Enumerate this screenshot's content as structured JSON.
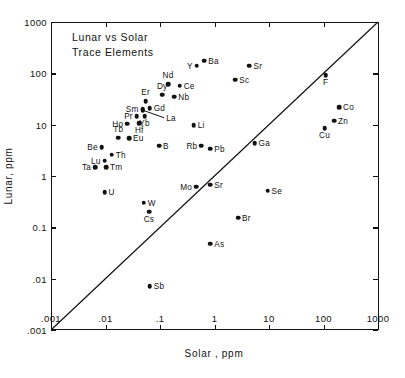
{
  "chart_data": {
    "type": "scatter",
    "title": "Lunar vs Solar Trace Elements",
    "title_lines": [
      "Lunar vs Solar",
      "Trace Elements"
    ],
    "xlabel": "Solar , ppm",
    "ylabel": "Lunar, ppm",
    "xscale": "log",
    "yscale": "log",
    "xlim": [
      0.001,
      1000
    ],
    "ylim": [
      0.001,
      1000
    ],
    "grid": false,
    "legend": "none",
    "xticklabels": [
      ".001",
      ".01",
      ".1",
      "1",
      "10",
      "100",
      "1000"
    ],
    "yticklabels": [
      ".001",
      ".01",
      "0.1",
      "1",
      "10",
      "100",
      "1000"
    ],
    "xtickvalues": [
      0.001,
      0.01,
      0.1,
      1,
      10,
      100,
      1000
    ],
    "ytickvalues": [
      0.001,
      0.01,
      0.1,
      1,
      10,
      100,
      1000
    ],
    "annotations": [
      {
        "name": "one-to-one-line",
        "type": "reference-line",
        "description": "1:1 diagonal line from (.001,.001) to (1000,1000)",
        "from": [
          0.001,
          0.001
        ],
        "to": [
          1000,
          1000
        ]
      },
      {
        "name": "la-leader-line",
        "type": "leader-line",
        "label": "La",
        "from_label_xy": [
          0.115,
          13.5
        ],
        "to_point_xy": [
          0.046,
          19.0
        ]
      }
    ],
    "points": [
      {
        "label": "Ba",
        "x": 0.62,
        "y": 175,
        "lpos": "right"
      },
      {
        "label": "Y",
        "x": 0.45,
        "y": 140,
        "lpos": "left"
      },
      {
        "label": "Sr",
        "x": 4.2,
        "y": 140,
        "lpos": "right"
      },
      {
        "label": "Sc",
        "x": 2.3,
        "y": 75,
        "lpos": "right"
      },
      {
        "label": "Nd",
        "x": 0.135,
        "y": 62,
        "lpos": "above"
      },
      {
        "label": "Ce",
        "x": 0.22,
        "y": 57,
        "lpos": "right"
      },
      {
        "label": "Dy",
        "x": 0.105,
        "y": 38,
        "lpos": "above"
      },
      {
        "label": "Nb",
        "x": 0.175,
        "y": 35,
        "lpos": "right"
      },
      {
        "label": "Er",
        "x": 0.052,
        "y": 29,
        "lpos": "above"
      },
      {
        "label": "Gd",
        "x": 0.062,
        "y": 21,
        "lpos": "right"
      },
      {
        "label": "Sm",
        "x": 0.046,
        "y": 20,
        "lpos": "left"
      },
      {
        "label": "Yb",
        "x": 0.05,
        "y": 14.5,
        "lpos": "below"
      },
      {
        "label": "Pr",
        "x": 0.036,
        "y": 14.5,
        "lpos": "left"
      },
      {
        "label": "La",
        "x": 0.046,
        "y": 19.0,
        "lpos": "none"
      },
      {
        "label": "Hf",
        "x": 0.04,
        "y": 10.8,
        "lpos": "below"
      },
      {
        "label": "Ho",
        "x": 0.024,
        "y": 10.5,
        "lpos": "left"
      },
      {
        "label": "Li",
        "x": 0.4,
        "y": 9.8,
        "lpos": "right"
      },
      {
        "label": "Tb",
        "x": 0.0165,
        "y": 5.6,
        "lpos": "above"
      },
      {
        "label": "Eu",
        "x": 0.026,
        "y": 5.4,
        "lpos": "right"
      },
      {
        "label": "Be",
        "x": 0.0082,
        "y": 3.6,
        "lpos": "left"
      },
      {
        "label": "B",
        "x": 0.092,
        "y": 3.9,
        "lpos": "right"
      },
      {
        "label": "Rb",
        "x": 0.55,
        "y": 3.9,
        "lpos": "left"
      },
      {
        "label": "Pb",
        "x": 0.8,
        "y": 3.4,
        "lpos": "right"
      },
      {
        "label": "Ga",
        "x": 5.2,
        "y": 4.3,
        "lpos": "right"
      },
      {
        "label": "Th",
        "x": 0.0125,
        "y": 2.6,
        "lpos": "right"
      },
      {
        "label": "Lu",
        "x": 0.0092,
        "y": 2.0,
        "lpos": "left"
      },
      {
        "label": "Tm",
        "x": 0.0098,
        "y": 1.5,
        "lpos": "right"
      },
      {
        "label": "Ta",
        "x": 0.0062,
        "y": 1.5,
        "lpos": "left"
      },
      {
        "label": "F",
        "x": 105,
        "y": 92,
        "lpos": "below"
      },
      {
        "label": "Co",
        "x": 185,
        "y": 22,
        "lpos": "right"
      },
      {
        "label": "Zn",
        "x": 150,
        "y": 12,
        "lpos": "right"
      },
      {
        "label": "Cu",
        "x": 100,
        "y": 8.6,
        "lpos": "below"
      },
      {
        "label": "Mo",
        "x": 0.44,
        "y": 0.62,
        "lpos": "left"
      },
      {
        "label": "Sr",
        "x": 0.8,
        "y": 0.68,
        "lpos": "right"
      },
      {
        "label": "Se",
        "x": 9.0,
        "y": 0.52,
        "lpos": "right"
      },
      {
        "label": "U",
        "x": 0.0092,
        "y": 0.48,
        "lpos": "right"
      },
      {
        "label": "W",
        "x": 0.048,
        "y": 0.3,
        "lpos": "right"
      },
      {
        "label": "Cs",
        "x": 0.06,
        "y": 0.2,
        "lpos": "below"
      },
      {
        "label": "Br",
        "x": 2.6,
        "y": 0.155,
        "lpos": "right"
      },
      {
        "label": "As",
        "x": 0.8,
        "y": 0.048,
        "lpos": "right"
      },
      {
        "label": "Sb",
        "x": 0.062,
        "y": 0.0072,
        "lpos": "right"
      }
    ]
  }
}
